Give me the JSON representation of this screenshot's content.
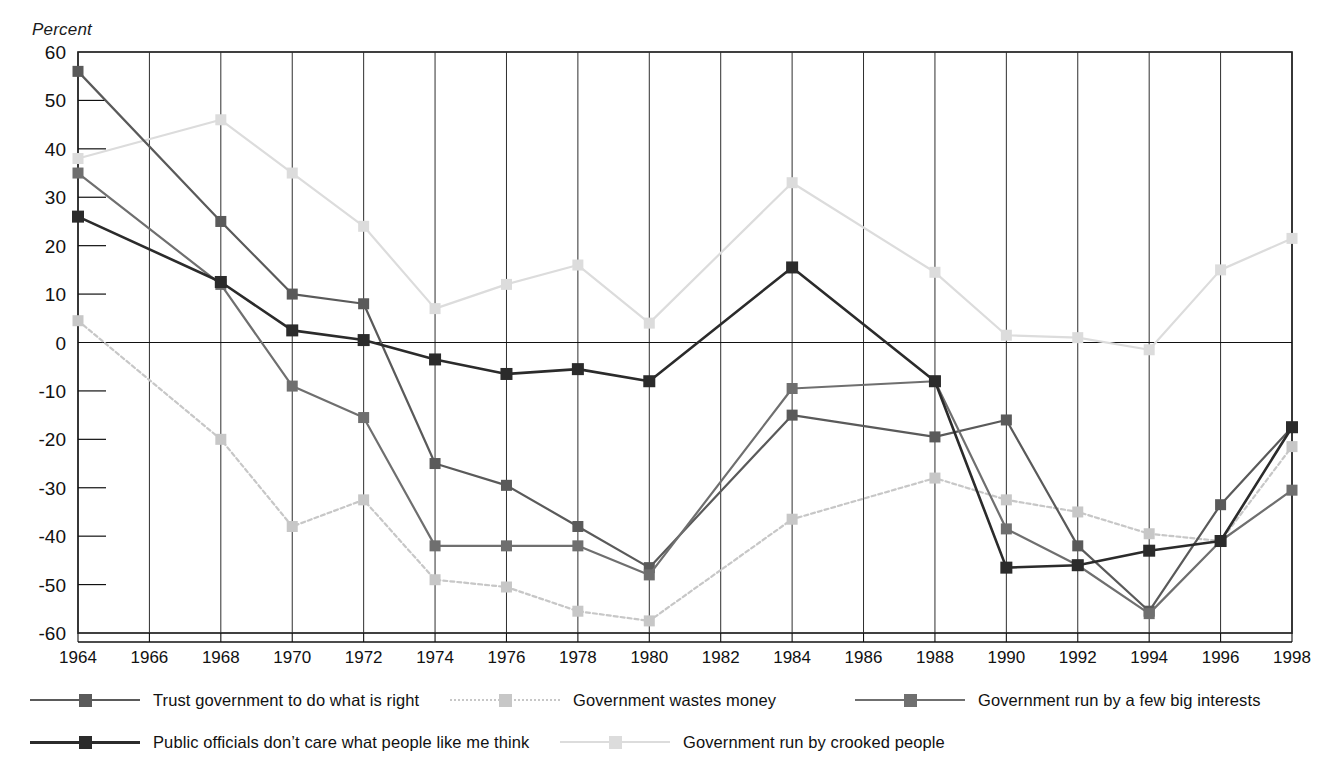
{
  "chart_data": {
    "type": "line",
    "title": "",
    "ylabel": "Percent",
    "xlabel": "",
    "ylim": [
      -60,
      60
    ],
    "ytick_step": 10,
    "yticks": [
      60,
      50,
      40,
      30,
      20,
      10,
      0,
      -10,
      -20,
      -30,
      -40,
      -50,
      -60
    ],
    "grid": "vertical gridlines at every labeled year; horizontal zero line",
    "legend_position": "below-plot",
    "x": [
      1964,
      1966,
      1968,
      1970,
      1972,
      1974,
      1976,
      1978,
      1980,
      1982,
      1984,
      1986,
      1988,
      1990,
      1992,
      1994,
      1996,
      1998
    ],
    "categories": [
      "1964",
      "1966",
      "1968",
      "1970",
      "1972",
      "1974",
      "1976",
      "1978",
      "1980",
      "1982",
      "1984",
      "1986",
      "1988",
      "1990",
      "1992",
      "1994",
      "1996",
      "1998"
    ],
    "series": [
      {
        "name": "Trust government to do what is right",
        "color": "#5a5a5a",
        "style": "solid",
        "points": [
          {
            "x": 1964,
            "y": 56
          },
          {
            "x": 1968,
            "y": 25
          },
          {
            "x": 1970,
            "y": 10
          },
          {
            "x": 1972,
            "y": 8
          },
          {
            "x": 1974,
            "y": -25
          },
          {
            "x": 1976,
            "y": -29.5
          },
          {
            "x": 1978,
            "y": -38
          },
          {
            "x": 1980,
            "y": -46.5
          },
          {
            "x": 1984,
            "y": -15
          },
          {
            "x": 1988,
            "y": -19.5
          },
          {
            "x": 1990,
            "y": -16
          },
          {
            "x": 1992,
            "y": -42
          },
          {
            "x": 1994,
            "y": -55.5
          },
          {
            "x": 1996,
            "y": -33.5
          },
          {
            "x": 1998,
            "y": -17.5
          }
        ]
      },
      {
        "name": "Government wastes money",
        "color": "#c7c7c7",
        "style": "dotted",
        "points": [
          {
            "x": 1964,
            "y": 4.5
          },
          {
            "x": 1968,
            "y": -20
          },
          {
            "x": 1970,
            "y": -38
          },
          {
            "x": 1972,
            "y": -32.5
          },
          {
            "x": 1974,
            "y": -49
          },
          {
            "x": 1976,
            "y": -50.5
          },
          {
            "x": 1978,
            "y": -55.5
          },
          {
            "x": 1980,
            "y": -57.5
          },
          {
            "x": 1984,
            "y": -36.5
          },
          {
            "x": 1988,
            "y": -28
          },
          {
            "x": 1990,
            "y": -32.5
          },
          {
            "x": 1992,
            "y": -35
          },
          {
            "x": 1994,
            "y": -39.5
          },
          {
            "x": 1996,
            "y": -41
          },
          {
            "x": 1998,
            "y": -21.5
          }
        ]
      },
      {
        "name": "Government run by a few big interests",
        "color": "#6f6f6f",
        "style": "solid",
        "points": [
          {
            "x": 1964,
            "y": 35
          },
          {
            "x": 1968,
            "y": 12
          },
          {
            "x": 1970,
            "y": -9
          },
          {
            "x": 1972,
            "y": -15.5
          },
          {
            "x": 1974,
            "y": -42
          },
          {
            "x": 1976,
            "y": -42
          },
          {
            "x": 1978,
            "y": -42
          },
          {
            "x": 1980,
            "y": -48
          },
          {
            "x": 1984,
            "y": -9.5
          },
          {
            "x": 1988,
            "y": -8
          },
          {
            "x": 1990,
            "y": -38.5
          },
          {
            "x": 1992,
            "y": -46
          },
          {
            "x": 1994,
            "y": -56
          },
          {
            "x": 1996,
            "y": -41
          },
          {
            "x": 1998,
            "y": -30.5
          }
        ]
      },
      {
        "name": "Public officials don't care what people like me think",
        "color": "#2b2b2b",
        "style": "solid",
        "points": [
          {
            "x": 1964,
            "y": 26
          },
          {
            "x": 1968,
            "y": 12.5
          },
          {
            "x": 1970,
            "y": 2.5
          },
          {
            "x": 1972,
            "y": 0.5
          },
          {
            "x": 1974,
            "y": -3.5
          },
          {
            "x": 1976,
            "y": -6.5
          },
          {
            "x": 1978,
            "y": -5.5
          },
          {
            "x": 1980,
            "y": -8
          },
          {
            "x": 1984,
            "y": 15.5
          },
          {
            "x": 1988,
            "y": -8
          },
          {
            "x": 1990,
            "y": -46.5
          },
          {
            "x": 1992,
            "y": -46
          },
          {
            "x": 1994,
            "y": -43
          },
          {
            "x": 1996,
            "y": -41
          },
          {
            "x": 1998,
            "y": -17.5
          }
        ]
      },
      {
        "name": "Government run by crooked people",
        "color": "#dcdcdc",
        "style": "solid",
        "points": [
          {
            "x": 1964,
            "y": 38
          },
          {
            "x": 1968,
            "y": 46
          },
          {
            "x": 1970,
            "y": 35
          },
          {
            "x": 1972,
            "y": 24
          },
          {
            "x": 1974,
            "y": 7
          },
          {
            "x": 1976,
            "y": 12
          },
          {
            "x": 1978,
            "y": 16
          },
          {
            "x": 1980,
            "y": 4
          },
          {
            "x": 1984,
            "y": 33
          },
          {
            "x": 1988,
            "y": 14.5
          },
          {
            "x": 1990,
            "y": 1.5
          },
          {
            "x": 1992,
            "y": 1
          },
          {
            "x": 1994,
            "y": -1.5
          },
          {
            "x": 1996,
            "y": 15
          },
          {
            "x": 1998,
            "y": 21.5
          }
        ]
      }
    ]
  },
  "axis": {
    "y_title": "Percent",
    "y_tick_labels": [
      "60",
      "50",
      "40",
      "30",
      "20",
      "10",
      "0",
      "-10",
      "-20",
      "-30",
      "-40",
      "-50",
      "-60"
    ],
    "x_tick_labels": [
      "1964",
      "1966",
      "1968",
      "1970",
      "1972",
      "1974",
      "1976",
      "1978",
      "1980",
      "1982",
      "1984",
      "1986",
      "1988",
      "1990",
      "1992",
      "1994",
      "1996",
      "1998"
    ]
  },
  "legend": {
    "items": [
      {
        "label": "Trust government to do what is right",
        "color": "#5a5a5a",
        "style": "solid"
      },
      {
        "label": "Government wastes money",
        "color": "#c7c7c7",
        "style": "dotted"
      },
      {
        "label": "Government run by a few big interests",
        "color": "#6f6f6f",
        "style": "solid"
      },
      {
        "label": "Public officials don’t care what people like me think",
        "color": "#2b2b2b",
        "style": "solid"
      },
      {
        "label": "Government run by crooked people",
        "color": "#dcdcdc",
        "style": "solid"
      }
    ]
  }
}
